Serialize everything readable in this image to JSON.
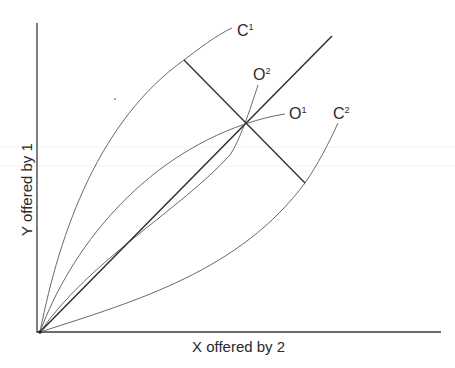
{
  "diagram": {
    "x_axis_label": "X offered by 2",
    "y_axis_label": "Y offered by 1",
    "curves": [
      {
        "id": "C1",
        "base": "C",
        "sup": "1",
        "label_x": 237,
        "label_y": 36
      },
      {
        "id": "O2",
        "base": "O",
        "sup": "2",
        "label_x": 253,
        "label_y": 80
      },
      {
        "id": "O1",
        "base": "O",
        "sup": "1",
        "label_x": 290,
        "label_y": 118
      },
      {
        "id": "C2",
        "base": "C",
        "sup": "2",
        "label_x": 333,
        "label_y": 118
      }
    ],
    "origin": {
      "x": 40,
      "y": 332
    },
    "equilibrium_point": {
      "x": 245,
      "y": 124
    },
    "colors": {
      "axis": "#3a3a3a",
      "curve": "#6a6a6a",
      "text": "#2a2a2a",
      "background": "#ffffff"
    }
  }
}
